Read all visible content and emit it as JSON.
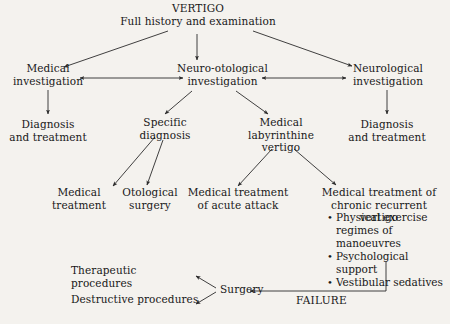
{
  "diagram": {
    "title": "VERTIGO",
    "subtitle": "Full history and examination",
    "nodes": {
      "root_title": "VERTIGO",
      "root_subtitle": "Full history and examination",
      "medical_investigation": "Medical\ninvestigation",
      "neuro_otological_investigation": "Neuro-otological\ninvestigation",
      "neurological_investigation": "Neurological\ninvestigation",
      "diagnosis_treatment_left": "Diagnosis\nand treatment",
      "diagnosis_treatment_right": "Diagnosis\nand treatment",
      "specific_diagnosis": "Specific\ndiagnosis",
      "medical_labyrinthine_vertigo": "Medical\nlabyrinthine\nvertigo",
      "medical_treatment": "Medical\ntreatment",
      "otological_surgery": "Otological\nsurgery",
      "medical_treatment_acute": "Medical treatment\nof acute attack",
      "medical_treatment_chronic": "Medical treatment of\nchronic recurrent vertigo",
      "therapeutic_procedures": "Therapeutic procedures",
      "destructive_procedures": "Destructive procedures",
      "surgery": "Surgery",
      "failure": "FAILURE"
    },
    "chronic_bullets": [
      "Physical exercise\nregimes of manoeuvres",
      "Psychological support",
      "Vestibular sedatives"
    ],
    "colors": {
      "background": "#f4f2ee",
      "text": "#181818",
      "stroke": "#2b2b2b"
    }
  }
}
